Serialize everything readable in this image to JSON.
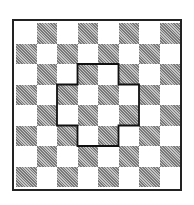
{
  "chart_data": null,
  "board": {
    "rows": 8,
    "cols": 8,
    "top_left_color": "light",
    "light_color": "#ffffff",
    "dark_color": "#9a9a9a",
    "border_color": "#222222"
  },
  "cross_outline": {
    "description": "Cross/plus-shaped region outlined on board",
    "cells": [
      [
        2,
        3
      ],
      [
        2,
        4
      ],
      [
        3,
        2
      ],
      [
        3,
        3
      ],
      [
        3,
        4
      ],
      [
        3,
        5
      ],
      [
        4,
        2
      ],
      [
        4,
        3
      ],
      [
        4,
        4
      ],
      [
        4,
        5
      ],
      [
        5,
        3
      ],
      [
        5,
        4
      ]
    ],
    "stroke_color": "#111111"
  }
}
